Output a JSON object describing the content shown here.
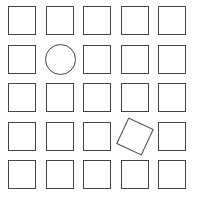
{
  "grid": {
    "rows": 5,
    "cols": 5,
    "stroke_color": "#444444",
    "background": "#ffffff",
    "cells": [
      {
        "row": 0,
        "col": 0,
        "shape": "square"
      },
      {
        "row": 0,
        "col": 1,
        "shape": "square"
      },
      {
        "row": 0,
        "col": 2,
        "shape": "square"
      },
      {
        "row": 0,
        "col": 3,
        "shape": "square"
      },
      {
        "row": 0,
        "col": 4,
        "shape": "square"
      },
      {
        "row": 1,
        "col": 0,
        "shape": "square"
      },
      {
        "row": 1,
        "col": 1,
        "shape": "circle"
      },
      {
        "row": 1,
        "col": 2,
        "shape": "square"
      },
      {
        "row": 1,
        "col": 3,
        "shape": "square"
      },
      {
        "row": 1,
        "col": 4,
        "shape": "square"
      },
      {
        "row": 2,
        "col": 0,
        "shape": "square"
      },
      {
        "row": 2,
        "col": 1,
        "shape": "square"
      },
      {
        "row": 2,
        "col": 2,
        "shape": "square"
      },
      {
        "row": 2,
        "col": 3,
        "shape": "square"
      },
      {
        "row": 2,
        "col": 4,
        "shape": "square"
      },
      {
        "row": 3,
        "col": 0,
        "shape": "square"
      },
      {
        "row": 3,
        "col": 1,
        "shape": "square"
      },
      {
        "row": 3,
        "col": 2,
        "shape": "square"
      },
      {
        "row": 3,
        "col": 3,
        "shape": "rotated-square"
      },
      {
        "row": 3,
        "col": 4,
        "shape": "square"
      },
      {
        "row": 4,
        "col": 0,
        "shape": "square"
      },
      {
        "row": 4,
        "col": 1,
        "shape": "square"
      },
      {
        "row": 4,
        "col": 2,
        "shape": "square"
      },
      {
        "row": 4,
        "col": 3,
        "shape": "square"
      },
      {
        "row": 4,
        "col": 4,
        "shape": "square"
      }
    ]
  }
}
